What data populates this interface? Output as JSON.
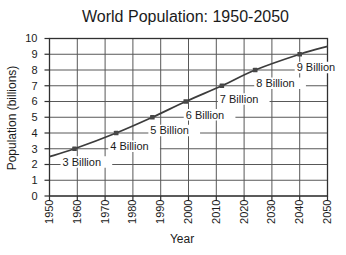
{
  "chart_data": {
    "type": "line",
    "title": "World Population: 1950-2050",
    "xlabel": "Year",
    "ylabel": "Population  (billions)",
    "xlim": [
      1950,
      2050
    ],
    "ylim": [
      0,
      10
    ],
    "x_ticks": [
      1950,
      1960,
      1970,
      1980,
      1990,
      2000,
      2010,
      2020,
      2030,
      2040,
      2050
    ],
    "y_ticks": [
      0,
      1,
      2,
      3,
      4,
      5,
      6,
      7,
      8,
      9,
      10
    ],
    "grid": true,
    "legend": "none",
    "colors": {
      "line": "#3c3c3c",
      "marker": "#474747",
      "grid": "#585858",
      "frame": "#303030",
      "text": "#1b1b1b",
      "background": "#ffffff"
    },
    "series": [
      {
        "name": "world-population",
        "points": [
          {
            "year": 1950,
            "value": 2.5
          },
          {
            "year": 1959,
            "value": 3,
            "label": "3 Billion",
            "label_dx": -12
          },
          {
            "year": 1974,
            "value": 4,
            "label": "4 Billion",
            "label_dx": -6
          },
          {
            "year": 1987,
            "value": 5,
            "label": "5 Billion",
            "label_dx": -2
          },
          {
            "year": 1999,
            "value": 6,
            "label": "6 Billion",
            "label_dx": 0
          },
          {
            "year": 2012,
            "value": 7,
            "label": "7 Billion",
            "label_dx": -2
          },
          {
            "year": 2024,
            "value": 8,
            "label": "8 Billion",
            "label_dx": 1
          },
          {
            "year": 2040,
            "value": 9,
            "label": "9 Billion",
            "label_dx": -3
          },
          {
            "year": 2050,
            "value": 9.5
          }
        ]
      }
    ]
  }
}
